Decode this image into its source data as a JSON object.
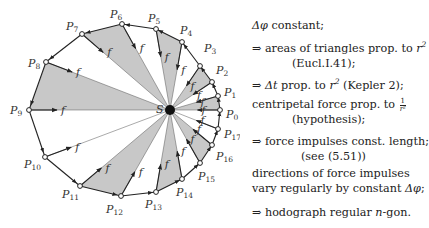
{
  "diagram": {
    "center": {
      "label": "S",
      "x": 170,
      "y": 110
    },
    "points": [
      {
        "label": "P",
        "sub": "0",
        "x": 220,
        "y": 110,
        "lx": 226,
        "ly": 118
      },
      {
        "label": "P",
        "sub": "1",
        "x": 218,
        "y": 96,
        "lx": 224,
        "ly": 96
      },
      {
        "label": "P",
        "sub": "2",
        "x": 212,
        "y": 82,
        "lx": 216,
        "ly": 74
      },
      {
        "label": "P",
        "sub": "3",
        "x": 200,
        "y": 66,
        "lx": 204,
        "ly": 52
      },
      {
        "label": "P",
        "sub": "4",
        "x": 182,
        "y": 42,
        "lx": 180,
        "ly": 34
      },
      {
        "label": "P",
        "sub": "5",
        "x": 156,
        "y": 29,
        "lx": 148,
        "ly": 22
      },
      {
        "label": "P",
        "sub": "6",
        "x": 122,
        "y": 24,
        "lx": 110,
        "ly": 18
      },
      {
        "label": "P",
        "sub": "7",
        "x": 82,
        "y": 34,
        "lx": 66,
        "ly": 30
      },
      {
        "label": "P",
        "sub": "8",
        "x": 46,
        "y": 62,
        "lx": 28,
        "ly": 67
      },
      {
        "label": "P",
        "sub": "9",
        "x": 29,
        "y": 110,
        "lx": 10,
        "ly": 114
      },
      {
        "label": "P",
        "sub": "10",
        "x": 45,
        "y": 157,
        "lx": 24,
        "ly": 168
      },
      {
        "label": "P",
        "sub": "11",
        "x": 80,
        "y": 186,
        "lx": 62,
        "ly": 198
      },
      {
        "label": "P",
        "sub": "12",
        "x": 121,
        "y": 196,
        "lx": 106,
        "ly": 213
      },
      {
        "label": "P",
        "sub": "13",
        "x": 156,
        "y": 192,
        "lx": 145,
        "ly": 208
      },
      {
        "label": "P",
        "sub": "14",
        "x": 182,
        "y": 179,
        "lx": 176,
        "ly": 196
      },
      {
        "label": "P",
        "sub": "15",
        "x": 200,
        "y": 163,
        "lx": 198,
        "ly": 180
      },
      {
        "label": "P",
        "sub": "16",
        "x": 212,
        "y": 145,
        "lx": 216,
        "ly": 160
      },
      {
        "label": "P",
        "sub": "17",
        "x": 218,
        "y": 129,
        "lx": 224,
        "ly": 138
      }
    ],
    "shaded_triangles": [
      [
        0,
        1
      ],
      [
        2,
        3
      ],
      [
        4,
        5
      ],
      [
        6,
        7
      ],
      [
        8,
        9
      ],
      [
        11,
        12
      ],
      [
        13,
        14
      ],
      [
        15,
        16
      ]
    ],
    "force_label": "f",
    "fill_color": "#c8c8c8",
    "line_color": "#222222"
  },
  "notes": {
    "l1": {
      "a": "Δφ",
      "b": " constant;"
    },
    "l2": {
      "a": "⇒ areas of triangles prop. to ",
      "b": "r",
      "sup": "2"
    },
    "l3": "(Eucl.I.41);",
    "l4": {
      "a": "⇒ ",
      "b": "Δt",
      "c": " prop. to ",
      "d": "r",
      "sup": "2",
      "e": " (Kepler 2);"
    },
    "l5": {
      "a": "centripetal force prop. to ",
      "num": "1",
      "den": "r²"
    },
    "l6": "(hypothesis);",
    "l7": "⇒ force impulses const. length;",
    "l8": "(see (5.51))",
    "l9": "directions of force impulses",
    "l10": {
      "a": "vary regularly by constant ",
      "b": "Δφ",
      "c": ";"
    },
    "l11": {
      "a": "⇒ hodograph regular ",
      "b": "n",
      "c": "-gon."
    }
  }
}
